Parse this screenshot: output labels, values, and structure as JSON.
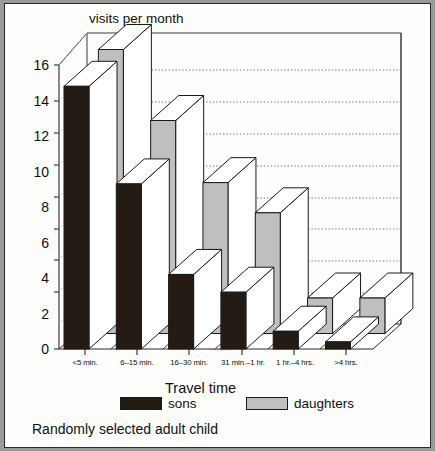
{
  "figure": {
    "caption": "Randomly selected adult child",
    "background": "#fdfdfb",
    "border_color": "#2a2a2a"
  },
  "chart_data": {
    "type": "bar",
    "title": "visits per month",
    "xlabel": "Travel time",
    "ylabel": "visits per month",
    "categories": [
      "<5 min.",
      "6–15 min.",
      "16–30 min.",
      "31 min.–1 hr.",
      "1 hr.–4 hrs.",
      ">4 hrs."
    ],
    "series": [
      {
        "name": "sons",
        "color": "#241c14",
        "values": [
          14.8,
          9.3,
          4.2,
          3.2,
          1.0,
          0.4
        ]
      },
      {
        "name": "daughters",
        "color": "#bfbfbf",
        "values": [
          16.0,
          12.0,
          8.5,
          6.8,
          2.0,
          2.0
        ]
      }
    ],
    "ylim": [
      0,
      16
    ],
    "yticks": [
      0,
      2,
      4,
      6,
      8,
      10,
      12,
      14,
      16
    ],
    "ytick_labels": [
      "0",
      "2",
      "4",
      "6",
      "8",
      "10",
      "12",
      "14",
      "16"
    ],
    "grid": true,
    "grid_axis": "y",
    "grid_style": "dotted",
    "legend_position": "bottom",
    "style": "3d-bar"
  },
  "legend": {
    "items": [
      {
        "label": "sons",
        "swatch": "sons"
      },
      {
        "label": "daughters",
        "swatch": "daughters"
      }
    ]
  }
}
